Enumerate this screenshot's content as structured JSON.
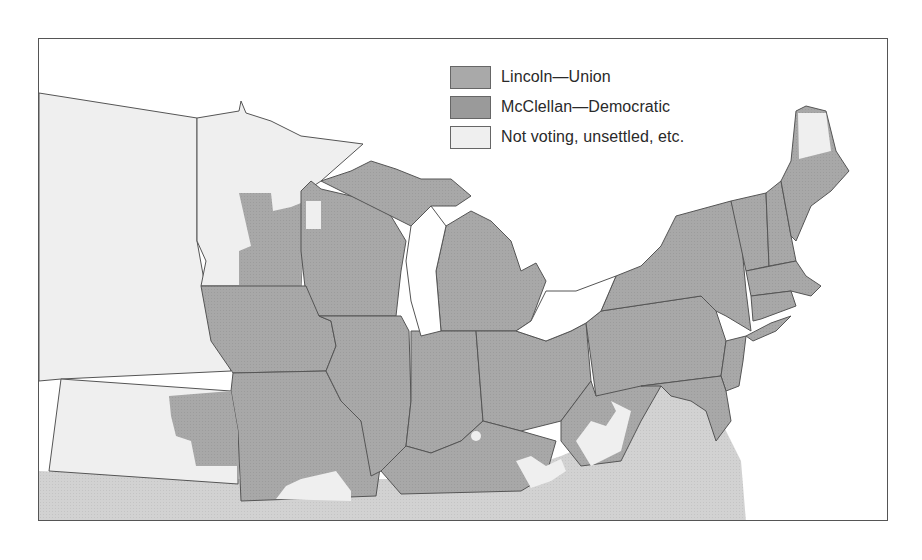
{
  "map": {
    "title": "",
    "colors": {
      "lincoln_union": "#a9a9a9",
      "mcclellan_democratic": "#9a9a9a",
      "not_voting": "#efefef",
      "confederate_south": "#cfcfcf",
      "water": "#ffffff",
      "border": "#4a4a4a"
    }
  },
  "legend": {
    "items": [
      {
        "label": "Lincoln—Union",
        "color": "#a9a9a9"
      },
      {
        "label": "McClellan—Democratic",
        "color": "#9a9a9a"
      },
      {
        "label": "Not voting, unsettled, etc.",
        "color": "#efefef"
      }
    ]
  }
}
